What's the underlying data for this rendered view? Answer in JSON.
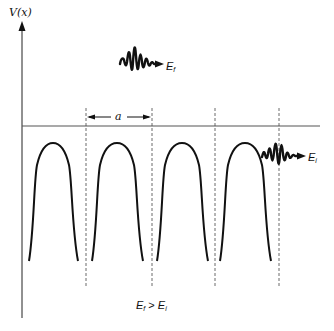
{
  "diagram": {
    "axis": {
      "ylabel": "V(x)"
    },
    "lattice": {
      "period_label": "a",
      "num_wells_shown": 4
    },
    "wave_packets": [
      {
        "id": "final",
        "label_base": "E",
        "label_sub": "f",
        "position": "above potential"
      },
      {
        "id": "initial",
        "label_base": "E",
        "label_sub": "i",
        "position": "near fourth potential peak"
      }
    ],
    "condition": {
      "lhs_base": "E",
      "lhs_sub": "f",
      "op": ">",
      "rhs_base": "E",
      "rhs_sub": "i"
    },
    "colors": {
      "line": "#111111",
      "baseline": "#555555",
      "dashed": "#444444"
    }
  }
}
